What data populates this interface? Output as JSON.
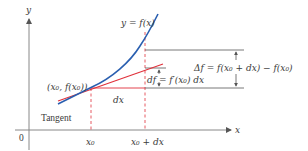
{
  "diagram": {
    "colors": {
      "curve": "#2a5fb0",
      "tangent": "#e0303a",
      "axes": "#777777",
      "guides": "#555555",
      "dashed": "#e0303a",
      "text": "#3a3a3a"
    },
    "axes": {
      "x_label": "x",
      "y_label": "y",
      "origin_label": "0"
    },
    "labels": {
      "curve": "y = f(x)",
      "point": "(x₀, f(x₀))",
      "tangent": "Tangent",
      "dx_segment": "dx",
      "df": "df = f′(x₀) dx",
      "delta_f": "Δf = f(x₀ + dx) − f(x₀)",
      "x0_tick": "x₀",
      "x0_dx_tick": "x₀ + dx"
    }
  }
}
